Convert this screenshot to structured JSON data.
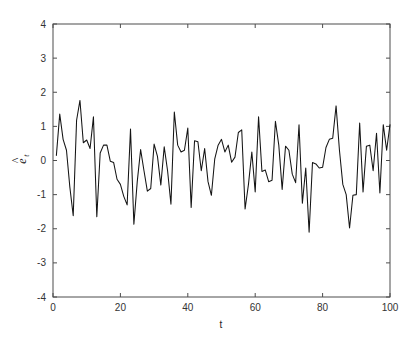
{
  "figure": {
    "name": "residual-time-series-plot",
    "background_color": "#ffffff",
    "axis_color": "#4d4d4d",
    "line_color": "#141414"
  },
  "chart_data": {
    "type": "line",
    "title": "",
    "subtitle": "",
    "xlabel": "t",
    "ylabel": "ê_t",
    "ylabel_base": "e",
    "ylabel_accent": "^",
    "ylabel_subscript": "t",
    "xlim": [
      0,
      100
    ],
    "ylim": [
      -4,
      4
    ],
    "xticks": [
      0,
      20,
      40,
      60,
      80,
      100
    ],
    "xticklabels": [
      "0",
      "20",
      "40",
      "60",
      "80",
      "100"
    ],
    "yticks": [
      -4,
      -3,
      -2,
      -1,
      0,
      1,
      2,
      3,
      4
    ],
    "yticklabels": [
      "-4",
      "-3",
      "-2",
      "-1",
      "0",
      "1",
      "2",
      "3",
      "4"
    ],
    "grid": false,
    "legend": null,
    "annotations": [],
    "series": [
      {
        "name": "residuals",
        "color": "#141414",
        "linewidth": 1,
        "marker": "none",
        "x": [
          1,
          2,
          3,
          4,
          5,
          6,
          7,
          8,
          9,
          10,
          11,
          12,
          13,
          14,
          15,
          16,
          17,
          18,
          19,
          20,
          21,
          22,
          23,
          24,
          25,
          26,
          27,
          28,
          29,
          30,
          31,
          32,
          33,
          34,
          35,
          36,
          37,
          38,
          39,
          40,
          41,
          42,
          43,
          44,
          45,
          46,
          47,
          48,
          49,
          50,
          51,
          52,
          53,
          54,
          55,
          56,
          57,
          58,
          59,
          60,
          61,
          62,
          63,
          64,
          65,
          66,
          67,
          68,
          69,
          70,
          71,
          72,
          73,
          74,
          75,
          76,
          77,
          78,
          79,
          80,
          81,
          82,
          83,
          84,
          85,
          86,
          87,
          88,
          89,
          90,
          91,
          92,
          93,
          94,
          95,
          96,
          97,
          98,
          99,
          100
        ],
        "values": [
          0.15,
          1.36,
          0.62,
          0.3,
          -0.78,
          -1.62,
          1.18,
          1.76,
          0.52,
          0.6,
          0.35,
          1.28,
          -1.65,
          0.22,
          0.45,
          0.45,
          -0.02,
          -0.06,
          -0.55,
          -0.7,
          -1.05,
          -1.3,
          0.92,
          -1.87,
          -0.62,
          0.32,
          -0.3,
          -0.9,
          -0.82,
          0.48,
          0.12,
          -0.72,
          0.4,
          -0.3,
          -1.28,
          1.42,
          0.45,
          0.25,
          0.3,
          0.95,
          -1.38,
          0.58,
          0.55,
          -0.3,
          0.35,
          -0.62,
          -1.02,
          0.05,
          0.45,
          0.62,
          0.25,
          0.45,
          -0.05,
          0.1,
          0.82,
          0.9,
          -1.42,
          -0.7,
          0.25,
          -0.92,
          1.28,
          -0.32,
          -0.28,
          -0.62,
          -0.58,
          1.15,
          0.45,
          -0.85,
          0.42,
          0.3,
          -0.4,
          -0.65,
          1.05,
          -1.25,
          -0.22,
          -2.1,
          -0.06,
          -0.1,
          -0.22,
          -0.2,
          0.38,
          0.62,
          0.65,
          1.6,
          0.3,
          -0.7,
          -1.0,
          -1.98,
          -1.02,
          -1.0,
          1.1,
          -0.92,
          0.42,
          0.45,
          -0.3,
          0.8,
          -0.95,
          1.05,
          0.3,
          1.05
        ]
      }
    ]
  },
  "geometry": {
    "plot_left": 53,
    "plot_right": 390,
    "plot_top": 24,
    "plot_bottom": 297
  }
}
